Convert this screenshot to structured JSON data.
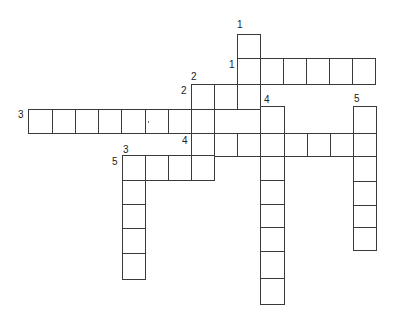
{
  "puzzle": {
    "type": "crossword",
    "line_color": "#3a3a3a",
    "background": "#ffffff",
    "cells": [
      {
        "x": 237,
        "y": 34,
        "w": 24,
        "h": 25
      },
      {
        "x": 237,
        "y": 58,
        "w": 24,
        "h": 27
      },
      {
        "x": 260,
        "y": 58,
        "w": 24,
        "h": 27
      },
      {
        "x": 283,
        "y": 58,
        "w": 24,
        "h": 27
      },
      {
        "x": 306,
        "y": 58,
        "w": 24,
        "h": 27
      },
      {
        "x": 329,
        "y": 58,
        "w": 24,
        "h": 27
      },
      {
        "x": 352,
        "y": 58,
        "w": 24,
        "h": 27
      },
      {
        "x": 191,
        "y": 84,
        "w": 24,
        "h": 26
      },
      {
        "x": 214,
        "y": 84,
        "w": 24,
        "h": 26
      },
      {
        "x": 237,
        "y": 84,
        "w": 24,
        "h": 26
      },
      {
        "x": 28,
        "y": 109,
        "w": 25,
        "h": 25
      },
      {
        "x": 52,
        "y": 109,
        "w": 24,
        "h": 25
      },
      {
        "x": 75,
        "y": 109,
        "w": 24,
        "h": 25
      },
      {
        "x": 98,
        "y": 109,
        "w": 24,
        "h": 25
      },
      {
        "x": 121,
        "y": 109,
        "w": 25,
        "h": 25
      },
      {
        "x": 145,
        "y": 109,
        "w": 24,
        "h": 25
      },
      {
        "x": 168,
        "y": 109,
        "w": 24,
        "h": 25
      },
      {
        "x": 191,
        "y": 109,
        "w": 24,
        "h": 25
      },
      {
        "x": 214,
        "y": 109,
        "w": 47,
        "h": 25
      },
      {
        "x": 260,
        "y": 106,
        "w": 25,
        "h": 28
      },
      {
        "x": 191,
        "y": 133,
        "w": 24,
        "h": 24
      },
      {
        "x": 214,
        "y": 133,
        "w": 24,
        "h": 24
      },
      {
        "x": 237,
        "y": 133,
        "w": 24,
        "h": 24
      },
      {
        "x": 260,
        "y": 133,
        "w": 25,
        "h": 24
      },
      {
        "x": 284,
        "y": 133,
        "w": 24,
        "h": 24
      },
      {
        "x": 307,
        "y": 133,
        "w": 24,
        "h": 24
      },
      {
        "x": 330,
        "y": 133,
        "w": 24,
        "h": 24
      },
      {
        "x": 353,
        "y": 133,
        "w": 24,
        "h": 24
      },
      {
        "x": 353,
        "y": 106,
        "w": 24,
        "h": 28
      },
      {
        "x": 122,
        "y": 155,
        "w": 24,
        "h": 26
      },
      {
        "x": 145,
        "y": 155,
        "w": 24,
        "h": 26
      },
      {
        "x": 168,
        "y": 155,
        "w": 24,
        "h": 26
      },
      {
        "x": 191,
        "y": 155,
        "w": 24,
        "h": 26
      },
      {
        "x": 122,
        "y": 180,
        "w": 24,
        "h": 25
      },
      {
        "x": 122,
        "y": 204,
        "w": 24,
        "h": 25
      },
      {
        "x": 122,
        "y": 228,
        "w": 24,
        "h": 26
      },
      {
        "x": 122,
        "y": 253,
        "w": 24,
        "h": 27
      },
      {
        "x": 260,
        "y": 156,
        "w": 25,
        "h": 25
      },
      {
        "x": 260,
        "y": 180,
        "w": 25,
        "h": 25
      },
      {
        "x": 260,
        "y": 204,
        "w": 25,
        "h": 24
      },
      {
        "x": 260,
        "y": 227,
        "w": 25,
        "h": 25
      },
      {
        "x": 260,
        "y": 251,
        "w": 25,
        "h": 28
      },
      {
        "x": 260,
        "y": 278,
        "w": 25,
        "h": 27
      },
      {
        "x": 353,
        "y": 156,
        "w": 24,
        "h": 26
      },
      {
        "x": 353,
        "y": 181,
        "w": 24,
        "h": 25
      },
      {
        "x": 353,
        "y": 205,
        "w": 24,
        "h": 23
      },
      {
        "x": 353,
        "y": 227,
        "w": 24,
        "h": 24
      }
    ],
    "numbers": [
      {
        "label": "1",
        "x": 237,
        "y": 20,
        "clue": "1-down"
      },
      {
        "label": "1",
        "x": 229,
        "y": 60,
        "clue": "1-across"
      },
      {
        "label": "2",
        "x": 191,
        "y": 72,
        "clue": "2-down"
      },
      {
        "label": "2",
        "x": 181,
        "y": 86,
        "clue": "2-across"
      },
      {
        "label": "3",
        "x": 18,
        "y": 110,
        "clue": "3-across"
      },
      {
        "label": "4",
        "x": 264,
        "y": 95,
        "clue": "4-down"
      },
      {
        "label": "5",
        "x": 354,
        "y": 94,
        "clue": "5-down"
      },
      {
        "label": "4",
        "x": 182,
        "y": 136,
        "clue": "4-across"
      },
      {
        "label": "3",
        "x": 123,
        "y": 145,
        "clue": "3-down"
      },
      {
        "label": "5",
        "x": 112,
        "y": 157,
        "clue": "5-across"
      }
    ]
  }
}
